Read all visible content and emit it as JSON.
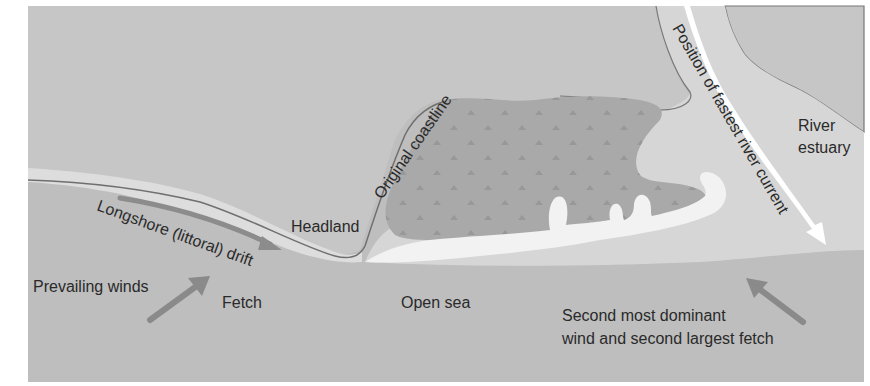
{
  "diagram": {
    "colors": {
      "land": "#c5c5c5",
      "sea": "#bdbdbd",
      "shore_light": "#dcdcdc",
      "spit_white": "#f3f3f3",
      "marsh": "#a9a9a9",
      "marsh_mark": "#979797",
      "coastline": "#6e6e6e",
      "arrow": "#8a8a8a",
      "river_arrow": "#ffffff",
      "text": "#2a2a2a"
    },
    "labels": {
      "original_coastline": "Original coastline",
      "headland": "Headland",
      "longshore_drift": "Longshore (littoral) drift",
      "prevailing_winds": "Prevailing winds",
      "fetch": "Fetch",
      "open_sea": "Open sea",
      "second_wind_line1": "Second most dominant",
      "second_wind_line2": "wind and second largest fetch",
      "river_current": "Position of fastest river current",
      "river_estuary_line1": "River",
      "river_estuary_line2": "estuary"
    },
    "icons": {
      "prevailing_wind_arrow": "arrow-up-right",
      "longshore_drift_arrow": "curved-arrow-right",
      "second_wind_arrow": "arrow-up-left",
      "river_current_arrow": "curved-arrow-down"
    }
  }
}
